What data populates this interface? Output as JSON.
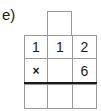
{
  "exercise": {
    "label": "e)",
    "carry_box": "",
    "rows": [
      [
        "1",
        "1",
        "2"
      ],
      [
        "×",
        "",
        "6"
      ],
      [
        "",
        "",
        ""
      ]
    ]
  }
}
